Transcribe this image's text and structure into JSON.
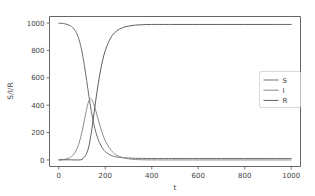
{
  "chart_data": {
    "type": "line",
    "title": "",
    "xlabel": "t",
    "ylabel": "S/I/R",
    "xlim": [
      -40,
      1040
    ],
    "ylim": [
      -48,
      1048
    ],
    "xticks": [
      0,
      200,
      400,
      600,
      800,
      1000
    ],
    "yticks": [
      0,
      200,
      400,
      600,
      800,
      1000
    ],
    "xtick_labels": [
      "0",
      "200",
      "400",
      "600",
      "800",
      "1000"
    ],
    "ytick_labels": [
      "0",
      "200",
      "400",
      "600",
      "800",
      "1000"
    ],
    "grid": false,
    "legend_position": "center right",
    "series": [
      {
        "name": "S",
        "color": "#6e6e6e",
        "x": [
          0,
          10,
          20,
          30,
          40,
          50,
          60,
          70,
          80,
          90,
          100,
          110,
          120,
          130,
          140,
          150,
          160,
          170,
          180,
          190,
          200,
          220,
          240,
          260,
          280,
          300,
          330,
          360,
          400,
          450,
          500,
          600,
          700,
          800,
          900,
          1000
        ],
        "values": [
          999,
          998,
          996,
          993,
          988,
          980,
          967,
          946,
          913,
          862,
          789,
          691,
          578,
          462,
          356,
          268,
          199,
          147,
          109,
          81,
          61,
          37,
          25,
          19,
          16,
          14,
          12,
          11,
          10,
          10,
          10,
          10,
          10,
          10,
          10,
          10
        ]
      },
      {
        "name": "I",
        "color": "#8c8c8c",
        "x": [
          0,
          10,
          20,
          30,
          40,
          50,
          60,
          70,
          80,
          90,
          100,
          110,
          120,
          130,
          140,
          150,
          160,
          170,
          180,
          190,
          200,
          220,
          240,
          260,
          280,
          300,
          330,
          360,
          400,
          450,
          500,
          600,
          700,
          800,
          900,
          1000
        ],
        "values": [
          1,
          2,
          3,
          6,
          11,
          19,
          33,
          55,
          89,
          139,
          207,
          289,
          373,
          434,
          444,
          411,
          355,
          292,
          233,
          182,
          140,
          81,
          46,
          26,
          15,
          8,
          3,
          1.2,
          0.4,
          0.1,
          0.0,
          0.0,
          0.0,
          0.0,
          0.0,
          0.0
        ]
      },
      {
        "name": "R",
        "color": "#5f5f5f",
        "x": [
          0,
          10,
          20,
          30,
          40,
          50,
          60,
          70,
          80,
          90,
          100,
          110,
          120,
          130,
          140,
          150,
          160,
          170,
          180,
          190,
          200,
          220,
          240,
          260,
          280,
          300,
          330,
          360,
          400,
          450,
          500,
          600,
          700,
          800,
          900,
          1000
        ],
        "values": [
          0,
          0,
          1,
          1,
          1,
          1,
          0,
          0,
          0,
          0,
          4,
          20,
          49,
          104,
          200,
          321,
          446,
          561,
          658,
          737,
          799,
          882,
          929,
          955,
          969,
          978,
          985,
          988,
          990,
          990,
          990,
          990,
          990,
          990,
          990,
          990
        ]
      }
    ],
    "legend_entries": [
      "S",
      "I",
      "R"
    ]
  },
  "figure": {
    "background_color": "#ffffff",
    "axis_color": "#555555",
    "text_color": "#3f3f3f"
  }
}
